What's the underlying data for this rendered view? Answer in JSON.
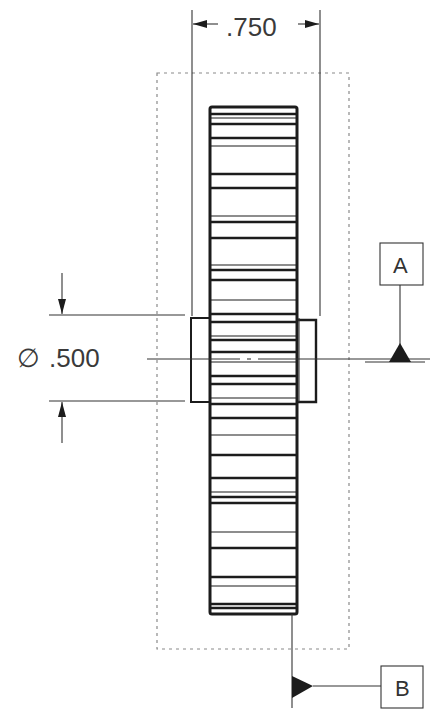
{
  "drawing": {
    "type": "engineering-drawing",
    "subject": "spur gear with hub, side view",
    "colors": {
      "line": "#1c1c1c",
      "thin_line": "#333333",
      "dotted": "#8a8a8a",
      "text": "#3a3a3a",
      "background": "#ffffff"
    }
  },
  "dimensions": {
    "width": {
      "label": ".750",
      "text": ".750"
    },
    "diameter": {
      "symbol": "∅",
      "text": ".500"
    }
  },
  "datums": {
    "a": {
      "label": "A"
    },
    "b": {
      "label": "B"
    }
  },
  "gear": {
    "body": {
      "x": 210,
      "y": 107,
      "width": 87,
      "height": 507
    },
    "hub": {
      "x": 190,
      "y": 316,
      "width": 126,
      "height": 86
    },
    "teeth_lines_y": [
      114,
      118,
      124,
      138,
      146,
      174,
      188,
      216,
      222,
      238,
      265,
      270,
      280,
      300,
      314,
      322,
      336,
      340,
      352,
      362,
      376,
      384,
      398,
      404,
      418,
      435,
      455,
      478,
      492,
      497,
      503,
      532,
      548,
      577,
      586,
      604,
      608
    ]
  },
  "boundary_box": {
    "x": 157,
    "y": 73,
    "width": 192,
    "height": 576
  }
}
